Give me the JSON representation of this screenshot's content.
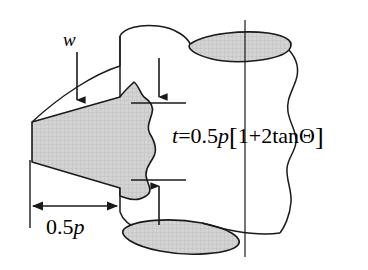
{
  "figure": {
    "background_color": "#ffffff",
    "line_color": "#1a1a1a",
    "hatch_fill_color": "#d2d2d2",
    "width": 368,
    "height": 270
  },
  "labels": {
    "w": {
      "text": "w",
      "name": "width-label",
      "style": "italic"
    },
    "half_p": {
      "text": "0.5",
      "symbol": "p",
      "name": "half-pitch-dimension-label"
    },
    "thickness_equation": {
      "lhs": "t",
      "equals": "=",
      "coefficient": "0.5",
      "pitch_symbol": "p",
      "bracket_open": "[",
      "expression": "1+2",
      "function": "tan",
      "angle_symbol": "Θ",
      "bracket_close": "]",
      "full_text": "t=0.5p[1+2tanΘ]",
      "name": "thickness-equation-label"
    }
  },
  "annotations": {
    "arrow_w": {
      "name": "w-leader-arrow",
      "direction": "down"
    },
    "arrow_t_top": {
      "name": "thickness-arrow-top",
      "direction": "down"
    },
    "arrow_t_bottom": {
      "name": "thickness-arrow-bottom",
      "direction": "up"
    },
    "dimension_half_p": {
      "name": "half-pitch-dimension-arrow",
      "direction": "double"
    },
    "centerline": {
      "name": "cylinder-centerline"
    },
    "break_line": {
      "name": "cylinder-break-line"
    }
  },
  "shapes": {
    "wedge": {
      "name": "tapered-wedge",
      "fill": "hatched"
    },
    "cylinder": {
      "name": "cylinder-body",
      "fill": "none"
    },
    "ellipse_top": {
      "name": "cylinder-top-section-ellipse",
      "fill": "hatched"
    },
    "ellipse_bottom": {
      "name": "cylinder-bottom-section-ellipse",
      "fill": "hatched"
    }
  }
}
